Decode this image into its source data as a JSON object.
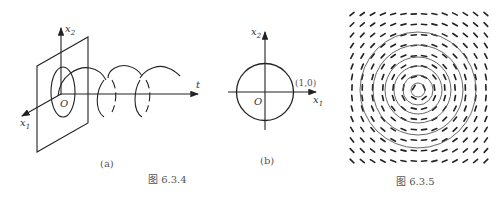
{
  "figure_634": {
    "caption": "图 6.3.4",
    "panel_a": {
      "label": "(a)",
      "axis_x2": "x",
      "axis_x2_sub": "2",
      "axis_x1": "x",
      "axis_x1_sub": "1",
      "axis_t": "t",
      "origin": "O"
    },
    "panel_b": {
      "label": "(b)",
      "axis_x2": "x",
      "axis_x2_sub": "2",
      "axis_x1": "x",
      "axis_x1_sub": "1",
      "origin": "O",
      "point_label": "(1,0)"
    }
  },
  "figure_635": {
    "caption": "图 6.3.5",
    "grid_cols": 14,
    "grid_rows": 15,
    "circle_count": 6
  },
  "colors": {
    "line": "#222222",
    "text": "#333333",
    "caption": "#555555"
  }
}
